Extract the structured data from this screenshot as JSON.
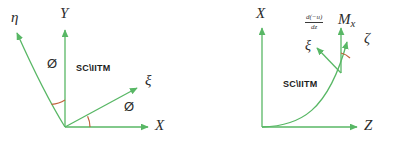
{
  "figure": {
    "watermark_text": "SC\\IITM",
    "colors": {
      "axis": "#58b765",
      "curve": "#58b765",
      "arc": "#c0603a",
      "text": "#2b2b2b",
      "background": "#ffffff"
    }
  },
  "left_diagram": {
    "name": "in-plane rotated axes",
    "origin_label": "",
    "axes": [
      {
        "id": "x-axis",
        "label": "X",
        "direction": "right"
      },
      {
        "id": "y-axis",
        "label": "Y",
        "direction": "up"
      },
      {
        "id": "xi-axis",
        "label": "ξ",
        "direction": "up-right"
      },
      {
        "id": "eta-axis",
        "label": "η",
        "direction": "up-left"
      }
    ],
    "angles": [
      {
        "id": "angle-x-xi",
        "label": "Ø",
        "between": [
          "X",
          "ξ"
        ]
      },
      {
        "id": "angle-y-eta",
        "label": "Ø",
        "between": [
          "Y",
          "η"
        ]
      }
    ],
    "watermark": "SC\\IITM"
  },
  "right_diagram": {
    "name": "deflected beam axes",
    "axes": [
      {
        "id": "x-axis",
        "label": "X",
        "direction": "up"
      },
      {
        "id": "z-axis",
        "label": "Z",
        "direction": "right"
      },
      {
        "id": "zeta-axis",
        "label": "ζ",
        "direction": "tangent-up-right"
      },
      {
        "id": "xi-axis",
        "label": "ξ",
        "direction": "normal-up-left"
      },
      {
        "id": "mx-axis",
        "label": "M",
        "sublabel": "x",
        "direction": "up"
      }
    ],
    "slope_expression": {
      "numerator": "d(−u)",
      "denominator": "dz",
      "attached_to": "ξ"
    },
    "angle": {
      "id": "angle-mx-zeta",
      "label": ""
    },
    "watermark": "SC\\IITM",
    "curve": "deflected elastic curve from origin rising to the right"
  }
}
